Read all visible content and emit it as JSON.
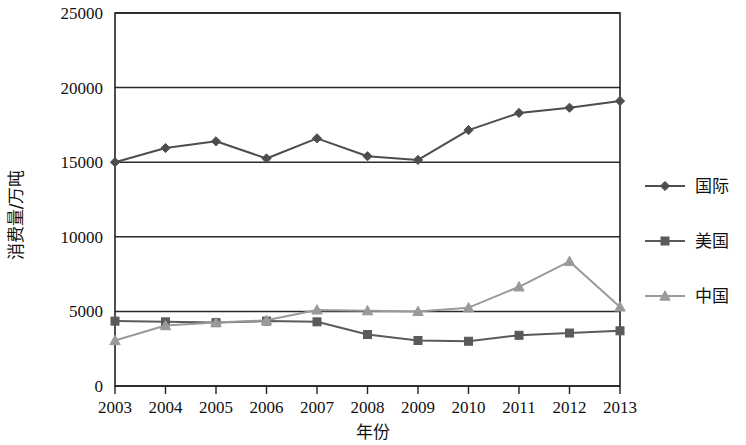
{
  "chart_data": {
    "type": "line",
    "title": "",
    "xlabel": "年份",
    "ylabel": "消费量/万吨",
    "categories": [
      "2003",
      "2004",
      "2005",
      "2006",
      "2007",
      "2008",
      "2009",
      "2010",
      "2011",
      "2012",
      "2013"
    ],
    "x": [
      2003,
      2004,
      2005,
      2006,
      2007,
      2008,
      2009,
      2010,
      2011,
      2012,
      2013
    ],
    "xlim": [
      2003,
      2013
    ],
    "ylim": [
      0,
      25000
    ],
    "ytick_labels": [
      "0",
      "5000",
      "10000",
      "15000",
      "20000",
      "25000"
    ],
    "ytick_values": [
      0,
      5000,
      10000,
      15000,
      20000,
      25000
    ],
    "grid": true,
    "grid_axis": "y",
    "legend_position": "right",
    "series": [
      {
        "name": "国际",
        "marker": "diamond",
        "color": "#4d4d4d",
        "values": [
          15000,
          15950,
          16400,
          15250,
          16600,
          15400,
          15150,
          17150,
          18300,
          18650,
          19100
        ]
      },
      {
        "name": "美国",
        "marker": "square",
        "color": "#5a5a5a",
        "values": [
          4350,
          4300,
          4250,
          4350,
          4300,
          3450,
          3050,
          3000,
          3400,
          3550,
          3700
        ]
      },
      {
        "name": "中国",
        "marker": "triangle",
        "color": "#9a9a9a",
        "values": [
          3050,
          4050,
          4250,
          4400,
          5100,
          5050,
          5000,
          5250,
          6650,
          8350,
          5300
        ]
      }
    ]
  },
  "legend": {
    "entries": [
      {
        "label": "国际",
        "marker": "diamond",
        "color": "#4d4d4d"
      },
      {
        "label": "美国",
        "marker": "square",
        "color": "#5a5a5a"
      },
      {
        "label": "中国",
        "marker": "triangle",
        "color": "#9a9a9a"
      }
    ]
  },
  "axes": {
    "y_axis_title": "消费量/万吨",
    "x_axis_title": "年份"
  },
  "colors": {
    "axis": "#222222",
    "grid": "#2b2b2b",
    "background": "#ffffff"
  }
}
